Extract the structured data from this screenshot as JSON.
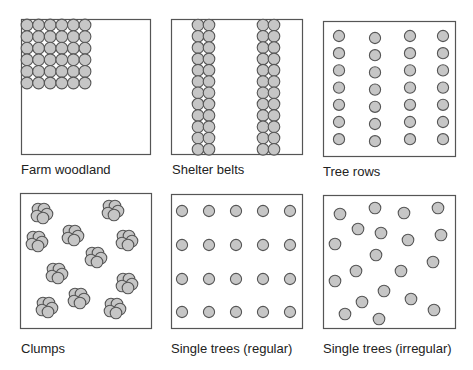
{
  "diagram": {
    "style": {
      "tree_fill": "#c6c6c6",
      "tree_stroke": "#555555",
      "box_stroke": "#555555",
      "background": "#ffffff"
    },
    "panels": [
      {
        "id": "farm-woodland",
        "label": "Farm woodland",
        "box": [
          21,
          19,
          129,
          135
        ],
        "label_pos": [
          21,
          162
        ],
        "pattern": "block",
        "block": {
          "cols": 6,
          "rows": 6,
          "x0": 27,
          "y0": 25,
          "step": 11.6,
          "r": 5.9
        }
      },
      {
        "id": "shelter-belts",
        "label": "Shelter belts",
        "box": [
          171,
          19,
          131,
          135
        ],
        "label_pos": [
          172,
          162
        ],
        "pattern": "belts",
        "belts": {
          "columns_x": [
            198,
            209,
            263,
            274
          ],
          "rows": 12,
          "y0": 25,
          "step": 11.3,
          "r": 5.8
        }
      },
      {
        "id": "tree-rows",
        "label": "Tree rows",
        "box": [
          323,
          21,
          132,
          135
        ],
        "label_pos": [
          323,
          164
        ],
        "pattern": "rows",
        "rows": {
          "columns_x": [
            339,
            375,
            410,
            443
          ],
          "column_y_offset": [
            0,
            2,
            0,
            0
          ],
          "count": 7,
          "y0": 36,
          "step": 17.2,
          "r": 5.6
        }
      },
      {
        "id": "clumps",
        "label": "Clumps",
        "box": [
          20,
          193,
          131,
          135
        ],
        "label_pos": [
          21,
          341
        ],
        "pattern": "clumps",
        "clump_r": 5.8,
        "clumps": [
          [
            41,
            213
          ],
          [
            112,
            210
          ],
          [
            36,
            241
          ],
          [
            72,
            235
          ],
          [
            126,
            240
          ],
          [
            95,
            257
          ],
          [
            56,
            273
          ],
          [
            126,
            283
          ],
          [
            46,
            307
          ],
          [
            78,
            298
          ],
          [
            114,
            308
          ]
        ]
      },
      {
        "id": "single-trees-regular",
        "label": "Single trees (regular)",
        "box": [
          171,
          194,
          131,
          134
        ],
        "label_pos": [
          171,
          341
        ],
        "pattern": "grid",
        "grid": {
          "columns_x": [
            182,
            209,
            236,
            263,
            290
          ],
          "rows_y": [
            211,
            245,
            279,
            312
          ],
          "r": 5.6
        }
      },
      {
        "id": "single-trees-irregular",
        "label": "Single trees (irregular)",
        "box": [
          323,
          195,
          132,
          133
        ],
        "label_pos": [
          323,
          341
        ],
        "pattern": "scatter",
        "scatter_r": 5.8,
        "points": [
          [
            340,
            214
          ],
          [
            375,
            208
          ],
          [
            404,
            213
          ],
          [
            438,
            208
          ],
          [
            358,
            229
          ],
          [
            381,
            233
          ],
          [
            408,
            240
          ],
          [
            441,
            235
          ],
          [
            335,
            244
          ],
          [
            376,
            255
          ],
          [
            433,
            262
          ],
          [
            356,
            271
          ],
          [
            401,
            271
          ],
          [
            335,
            281
          ],
          [
            384,
            291
          ],
          [
            411,
            299
          ],
          [
            362,
            302
          ],
          [
            434,
            310
          ],
          [
            345,
            314
          ],
          [
            379,
            319
          ]
        ]
      }
    ]
  }
}
